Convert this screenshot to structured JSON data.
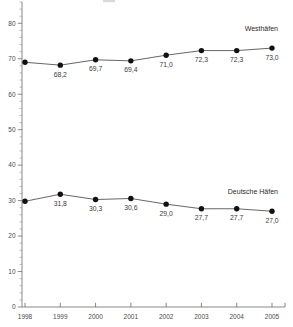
{
  "chart_data": {
    "type": "line",
    "title": "",
    "subtitle": "",
    "xlabel": "",
    "ylabel": "",
    "categories": [
      "1998",
      "1999",
      "2000",
      "2001",
      "2002",
      "2003",
      "2004",
      "2005"
    ],
    "x": [
      1998,
      1999,
      2000,
      2001,
      2002,
      2003,
      2004,
      2005
    ],
    "ylim": [
      0,
      86
    ],
    "xlim": [
      1998,
      2005
    ],
    "y_ticks": [
      0,
      10,
      20,
      30,
      40,
      50,
      60,
      70,
      80
    ],
    "y_tick_labels": [
      "0",
      "10",
      "20",
      "30",
      "40",
      "50",
      "60",
      "70",
      "80"
    ],
    "y_minor_tick_step": 2,
    "grid": false,
    "legend_position": "inline-right",
    "decimal_separator": ",",
    "series": [
      {
        "name": "Westhäfen",
        "values": [
          69.0,
          68.2,
          69.7,
          69.4,
          71.0,
          72.3,
          72.3,
          73.0
        ],
        "data_labels": [
          "",
          "68,2",
          "69,7",
          "69,4",
          "71,0",
          "72,3",
          "72,3",
          "73,0"
        ],
        "marker": "circle",
        "label_position": "above-right"
      },
      {
        "name": "Deutsche Häfen",
        "values": [
          29.8,
          31.8,
          30.3,
          30.6,
          29.0,
          27.7,
          27.7,
          27.0
        ],
        "data_labels": [
          "",
          "31,8",
          "30,3",
          "30,6",
          "29,0",
          "27,7",
          "27,7",
          "27,0"
        ],
        "marker": "circle",
        "label_position": "above-right"
      }
    ]
  },
  "labels": {
    "series_west": "Westhäfen",
    "series_deutsche": "Deutsche Häfen"
  },
  "colors": {
    "line": "#555555",
    "marker": "#111111",
    "axis": "#7a7a7a",
    "text": "#3a3a3a",
    "background": "#ffffff"
  }
}
